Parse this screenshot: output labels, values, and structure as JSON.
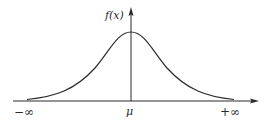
{
  "diagram": {
    "y_axis_label": "f(x)",
    "x_labels": {
      "left": "−∞",
      "center": "μ",
      "right": "+∞"
    },
    "colors": {
      "line": "#2a2a2a",
      "background": "#ffffff"
    }
  }
}
